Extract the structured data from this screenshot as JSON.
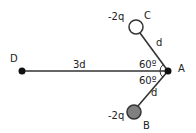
{
  "diagram": {
    "points": {
      "D": {
        "label": "D"
      },
      "A": {
        "label": "A"
      },
      "B": {
        "label": "B",
        "charge": "-2q"
      },
      "C": {
        "label": "C",
        "charge": "-2q"
      }
    },
    "segments": {
      "DA": {
        "length_label": "3d"
      },
      "AC": {
        "length_label": "d"
      },
      "AB": {
        "length_label": "d"
      }
    },
    "angles": {
      "DAC": {
        "label": "60º"
      },
      "DAB": {
        "label": "60º"
      }
    },
    "colors": {
      "line": "#333333",
      "dot": "#111111",
      "charge_C_fill": "#ffffff",
      "charge_B_fill": "#808080"
    }
  }
}
